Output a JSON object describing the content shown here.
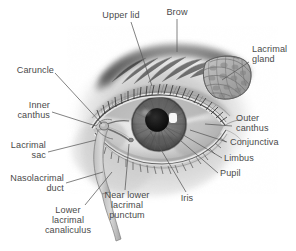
{
  "figure": {
    "type": "anatomical-illustration",
    "style": "grayscale pencil / airbrush medical illustration",
    "background_color": "#ffffff",
    "label_color": "#4a4a4a",
    "leader_line_color": "#585858",
    "artist_signature": "a.z.w."
  },
  "labels": [
    {
      "id": "upper-lid",
      "text": "Upper lid"
    },
    {
      "id": "brow",
      "text": "Brow"
    },
    {
      "id": "lacrimal-gland",
      "text": "Lacrimal\ngland"
    },
    {
      "id": "caruncle",
      "text": "Caruncle"
    },
    {
      "id": "inner-canthus",
      "text": "Inner\ncanthus"
    },
    {
      "id": "lacrimal-sac",
      "text": "Lacrimal\nsac"
    },
    {
      "id": "nasolacrimal-duct",
      "text": "Nasolacrimal\nduct"
    },
    {
      "id": "lower-lacrimal-canaliculus",
      "text": "Lower\nlacrimal\ncanaliculus"
    },
    {
      "id": "near-lower-lacrimal-punctum",
      "text": "Near lower\nlacrimal\npunctum"
    },
    {
      "id": "iris",
      "text": "Iris"
    },
    {
      "id": "pupil",
      "text": "Pupil"
    },
    {
      "id": "limbus",
      "text": "Limbus"
    },
    {
      "id": "conjunctiva",
      "text": "Conjunctiva"
    },
    {
      "id": "outer-canthus",
      "text": "Outer\ncanthus"
    }
  ]
}
